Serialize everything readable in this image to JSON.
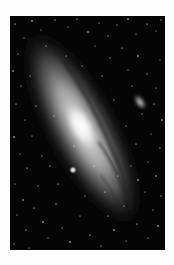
{
  "image": {
    "subject": "spiral galaxy photograph",
    "style": "grayscale astrophotography",
    "colors": {
      "page_background": "#fdfdfd",
      "sky": "#050505",
      "galaxy_halo": "#5a5a5a",
      "galaxy_disk": "#a8a8a8",
      "galaxy_core": "#ffffff",
      "dust_lanes": "#1a1a1a"
    },
    "elements": [
      {
        "name": "main-galaxy",
        "description": "large elongated spiral galaxy tilted diagonally from upper-left to lower-right with bright central core and dark dust lanes"
      },
      {
        "name": "satellite-galaxy-upper-right",
        "description": "small elliptical fuzzy galaxy in upper right"
      },
      {
        "name": "satellite-galaxy-compact",
        "description": "compact bright round satellite below-left of core"
      },
      {
        "name": "star-field",
        "description": "dense field of small foreground stars across black sky"
      }
    ]
  }
}
